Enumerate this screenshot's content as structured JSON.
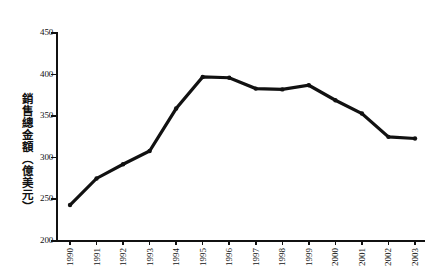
{
  "chart_data": {
    "type": "line",
    "title": "",
    "xlabel": "",
    "ylabel": "銷售總金額（億美元）",
    "categories": [
      "1990",
      "1991",
      "1992",
      "1993",
      "1994",
      "1995",
      "1996",
      "1997",
      "1998",
      "1999",
      "2000",
      "2001",
      "2002",
      "2003"
    ],
    "values": [
      242,
      274,
      291,
      307,
      358,
      396,
      395,
      382,
      381,
      386,
      368,
      352,
      324,
      322
    ],
    "series": [
      {
        "name": "銷售總金額",
        "values": [
          242,
          274,
          291,
          307,
          358,
          396,
          395,
          382,
          381,
          386,
          368,
          352,
          324,
          322
        ]
      }
    ],
    "ylim": [
      200,
      450
    ],
    "yticks": [
      200,
      250,
      300,
      350,
      400,
      450
    ],
    "ytick_labels": [
      "200",
      "250",
      "300",
      "350",
      "400",
      "450"
    ],
    "xtick_labels": [
      "1990",
      "1991",
      "1992",
      "1993",
      "1994",
      "1995",
      "1996",
      "1997",
      "1998",
      "1999",
      "2000",
      "2001",
      "2002",
      "2003"
    ],
    "grid": false,
    "legend": "none",
    "line_color": "#111111",
    "background_color": "#ffffff",
    "xlabel_rotation": 90
  }
}
